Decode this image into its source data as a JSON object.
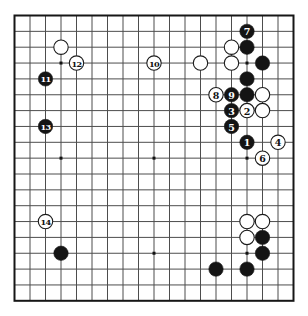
{
  "diagram": {
    "kind": "go-board-diagram",
    "move_range_shown": "1-14"
  },
  "board": {
    "size": 19,
    "colors": {
      "background": "#ffffff",
      "grid_line": "#4d4d4d",
      "border": "#161616",
      "black_stone": "#141414",
      "white_stone": "#ffffff",
      "stone_outline": "#1b1b1b",
      "label_on_black": "#ffffff",
      "label_on_white": "#111111",
      "star_point": "#111111"
    },
    "star_points": [
      [
        4,
        4
      ],
      [
        10,
        4
      ],
      [
        16,
        4
      ],
      [
        4,
        10
      ],
      [
        10,
        10
      ],
      [
        16,
        10
      ],
      [
        4,
        16
      ],
      [
        10,
        16
      ],
      [
        16,
        16
      ]
    ],
    "stones": [
      {
        "col": 4,
        "row": 3,
        "color": "white",
        "label": ""
      },
      {
        "col": 5,
        "row": 4,
        "color": "white",
        "label": "12"
      },
      {
        "col": 3,
        "row": 5,
        "color": "black",
        "label": "11"
      },
      {
        "col": 3,
        "row": 8,
        "color": "black",
        "label": "13"
      },
      {
        "col": 3,
        "row": 14,
        "color": "white",
        "label": "14"
      },
      {
        "col": 4,
        "row": 16,
        "color": "black",
        "label": ""
      },
      {
        "col": 10,
        "row": 4,
        "color": "white",
        "label": "10"
      },
      {
        "col": 13,
        "row": 4,
        "color": "white",
        "label": ""
      },
      {
        "col": 15,
        "row": 3,
        "color": "white",
        "label": ""
      },
      {
        "col": 16,
        "row": 2,
        "color": "black",
        "label": "7"
      },
      {
        "col": 16,
        "row": 3,
        "color": "black",
        "label": ""
      },
      {
        "col": 15,
        "row": 4,
        "color": "white",
        "label": ""
      },
      {
        "col": 17,
        "row": 4,
        "color": "black",
        "label": ""
      },
      {
        "col": 16,
        "row": 5,
        "color": "black",
        "label": ""
      },
      {
        "col": 14,
        "row": 6,
        "color": "white",
        "label": "8"
      },
      {
        "col": 15,
        "row": 6,
        "color": "black",
        "label": "9"
      },
      {
        "col": 16,
        "row": 6,
        "color": "black",
        "label": ""
      },
      {
        "col": 17,
        "row": 6,
        "color": "white",
        "label": ""
      },
      {
        "col": 15,
        "row": 7,
        "color": "black",
        "label": "3"
      },
      {
        "col": 16,
        "row": 7,
        "color": "white",
        "label": "2"
      },
      {
        "col": 17,
        "row": 7,
        "color": "white",
        "label": ""
      },
      {
        "col": 15,
        "row": 8,
        "color": "black",
        "label": "5"
      },
      {
        "col": 16,
        "row": 9,
        "color": "black",
        "label": "1"
      },
      {
        "col": 18,
        "row": 9,
        "color": "white",
        "label": "4"
      },
      {
        "col": 17,
        "row": 10,
        "color": "white",
        "label": "6"
      },
      {
        "col": 16,
        "row": 14,
        "color": "white",
        "label": ""
      },
      {
        "col": 17,
        "row": 14,
        "color": "white",
        "label": ""
      },
      {
        "col": 16,
        "row": 15,
        "color": "white",
        "label": ""
      },
      {
        "col": 17,
        "row": 15,
        "color": "black",
        "label": ""
      },
      {
        "col": 17,
        "row": 16,
        "color": "black",
        "label": ""
      },
      {
        "col": 14,
        "row": 17,
        "color": "black",
        "label": ""
      },
      {
        "col": 16,
        "row": 17,
        "color": "black",
        "label": ""
      }
    ]
  }
}
